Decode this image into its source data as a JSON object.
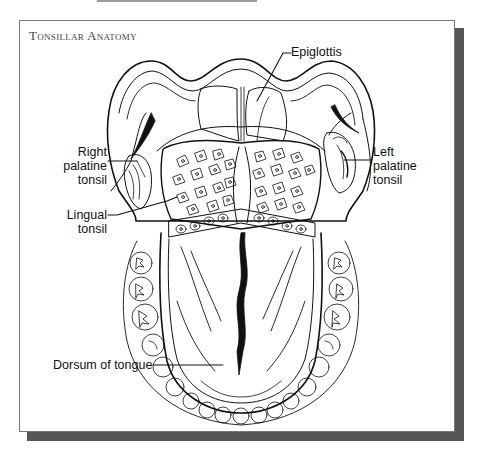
{
  "title": "Tonsillar Anatomy",
  "labels": {
    "epiglottis": "Epiglottis",
    "right_palatine_tonsil": [
      "Right",
      "palatine",
      "tonsil"
    ],
    "left_palatine_tonsil": [
      "Left",
      "palatine",
      "tonsil"
    ],
    "lingual_tonsil": [
      "Lingual",
      "tonsil"
    ],
    "dorsum_of_tongue": "Dorsum of tongue"
  },
  "colors": {
    "line": "#111111",
    "shadow": "#555555",
    "frame_border": "#777777",
    "title": "#444444"
  }
}
